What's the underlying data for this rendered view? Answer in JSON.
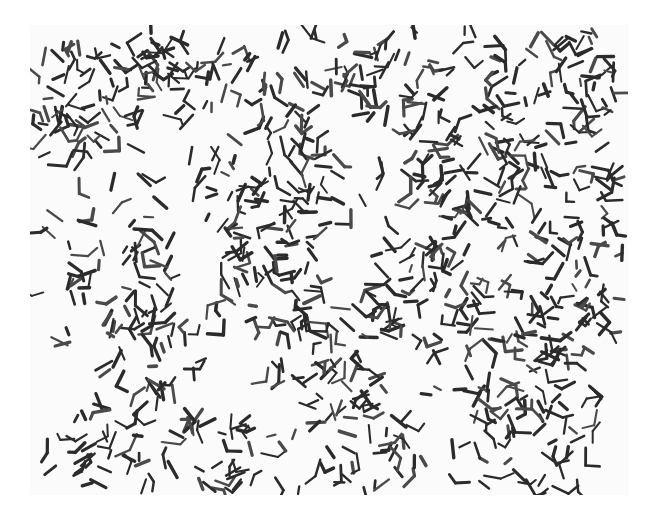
{
  "image": {
    "subject": "Light micrograph of rod-shaped bacteria (coryneform, V/L/palisade arrangements) on a white field",
    "alt": "Grayscale micrograph showing many dark rod-shaped bacterial cells scattered and clustered across a light background",
    "colors": {
      "background": "#ffffff",
      "field": "#fbfbfb",
      "cell_dark": "#2b2b2b",
      "cell_mid": "#4a4a4a"
    },
    "clusters": [
      {
        "x": 60,
        "y": 60,
        "r": 70,
        "n": 70
      },
      {
        "x": 150,
        "y": 40,
        "r": 60,
        "n": 40
      },
      {
        "x": 260,
        "y": 40,
        "r": 60,
        "n": 35
      },
      {
        "x": 370,
        "y": 55,
        "r": 55,
        "n": 40
      },
      {
        "x": 520,
        "y": 60,
        "r": 70,
        "n": 60
      },
      {
        "x": 240,
        "y": 160,
        "r": 70,
        "n": 55
      },
      {
        "x": 430,
        "y": 150,
        "r": 60,
        "n": 55
      },
      {
        "x": 540,
        "y": 170,
        "r": 60,
        "n": 40
      },
      {
        "x": 90,
        "y": 240,
        "r": 60,
        "n": 40
      },
      {
        "x": 240,
        "y": 260,
        "r": 60,
        "n": 45
      },
      {
        "x": 400,
        "y": 270,
        "r": 60,
        "n": 55
      },
      {
        "x": 540,
        "y": 280,
        "r": 55,
        "n": 40
      },
      {
        "x": 120,
        "y": 330,
        "r": 55,
        "n": 30
      },
      {
        "x": 300,
        "y": 340,
        "r": 60,
        "n": 35
      },
      {
        "x": 480,
        "y": 350,
        "r": 60,
        "n": 35
      },
      {
        "x": 80,
        "y": 430,
        "r": 55,
        "n": 35
      },
      {
        "x": 190,
        "y": 440,
        "r": 55,
        "n": 30
      },
      {
        "x": 340,
        "y": 430,
        "r": 60,
        "n": 35
      },
      {
        "x": 500,
        "y": 430,
        "r": 60,
        "n": 30
      }
    ],
    "scatter_count": 220,
    "seed": 1337
  }
}
